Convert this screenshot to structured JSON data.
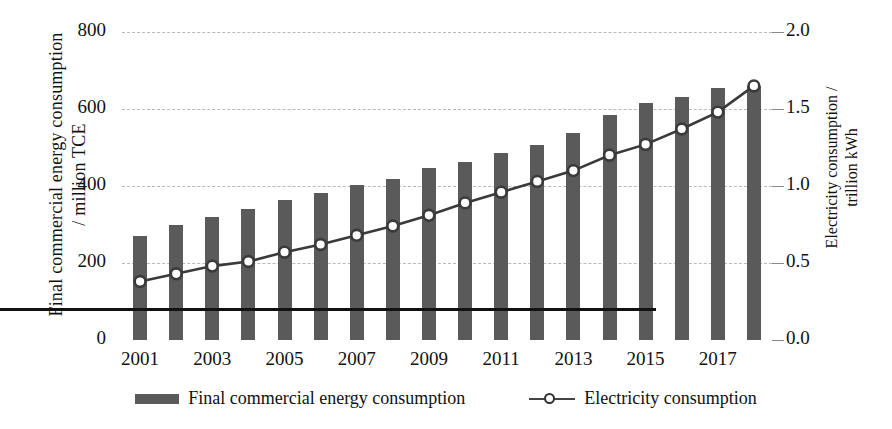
{
  "chart_data": {
    "type": "bar",
    "title": "",
    "xlabel": "",
    "ylabel": "Final commercial energy consumption / million TCE",
    "y2label": "Electricity consumption / trillion kWh",
    "grid": true,
    "legend_position": "bottom",
    "ylim": [
      0,
      800
    ],
    "y2lim": [
      0.0,
      2.0
    ],
    "yticks": [
      "0",
      "200",
      "400",
      "600",
      "800"
    ],
    "y2ticks": [
      "0.0",
      "0.5",
      "1.0",
      "1.5",
      "2.0"
    ],
    "categories": [
      "2001",
      "2002",
      "2003",
      "2004",
      "2005",
      "2006",
      "2007",
      "2008",
      "2009",
      "2010",
      "2011",
      "2012",
      "2013",
      "2014",
      "2015",
      "2016",
      "2017",
      "2018"
    ],
    "xtick_labels": [
      "2001",
      "2003",
      "2005",
      "2007",
      "2009",
      "2011",
      "2013",
      "2015",
      "2017"
    ],
    "series": [
      {
        "name": "Final commercial energy consumption",
        "type": "bar",
        "axis": "left",
        "unit": "million TCE",
        "color": "#5a5a5a",
        "values": [
          270,
          298,
          320,
          341,
          364,
          383,
          402,
          419,
          448,
          462,
          486,
          506,
          539,
          584,
          615,
          632,
          655,
          661
        ]
      },
      {
        "name": "Electricity consumption",
        "type": "line",
        "axis": "right",
        "unit": "trillion kWh",
        "color": "#3a3a3a",
        "marker": "open-circle",
        "values": [
          0.38,
          0.43,
          0.48,
          0.51,
          0.57,
          0.62,
          0.68,
          0.74,
          0.81,
          0.89,
          0.96,
          1.03,
          1.1,
          1.2,
          1.27,
          1.37,
          1.48,
          1.65
        ]
      }
    ]
  },
  "axis": {
    "left_title_line1": "Final commercial energy consumption",
    "left_title_line2": "/ million TCE",
    "right_title_line1": "Electricity consumption /",
    "right_title_line2": "trillion kWh"
  },
  "legend": {
    "items": [
      {
        "label": "Final commercial energy consumption",
        "marker": "bar-swatch"
      },
      {
        "label": "Electricity consumption",
        "marker": "line-circle-swatch"
      }
    ]
  }
}
